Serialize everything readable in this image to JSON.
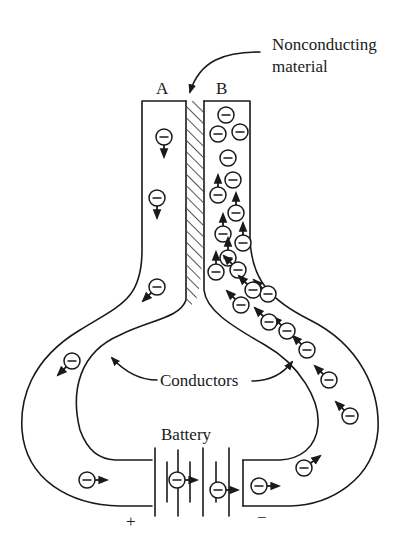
{
  "labels": {
    "a": "A",
    "b": "B",
    "nonconducting_1": "Nonconducting",
    "nonconducting_2": "material",
    "conductors": "Conductors",
    "battery": "Battery",
    "plus": "+",
    "minus": "−"
  },
  "colors": {
    "ink": "#1a1a1a",
    "background": "#ffffff"
  },
  "electrons": [
    {
      "x": 164,
      "y": 137,
      "dir": "down"
    },
    {
      "x": 157,
      "y": 198,
      "dir": "down"
    },
    {
      "x": 157,
      "y": 287,
      "dir": "down-left"
    },
    {
      "x": 72,
      "y": 361,
      "dir": "down-left"
    },
    {
      "x": 87,
      "y": 480,
      "dir": "right"
    },
    {
      "x": 177,
      "y": 480,
      "dir": "right"
    },
    {
      "x": 218,
      "y": 490,
      "dir": "right"
    },
    {
      "x": 259,
      "y": 486,
      "dir": "right"
    },
    {
      "x": 304,
      "y": 468,
      "dir": "up-right"
    },
    {
      "x": 350,
      "y": 416,
      "dir": "up-left"
    },
    {
      "x": 329,
      "y": 380,
      "dir": "up-left"
    },
    {
      "x": 307,
      "y": 350,
      "dir": "up-left"
    },
    {
      "x": 287,
      "y": 331,
      "dir": "up-left"
    },
    {
      "x": 269,
      "y": 322,
      "dir": "up-left"
    },
    {
      "x": 268,
      "y": 294,
      "dir": "up-left"
    },
    {
      "x": 241,
      "y": 305,
      "dir": "up-left"
    },
    {
      "x": 226,
      "y": 115,
      "dir": "none"
    },
    {
      "x": 240,
      "y": 132,
      "dir": "none"
    },
    {
      "x": 218,
      "y": 134,
      "dir": "none"
    },
    {
      "x": 228,
      "y": 158,
      "dir": "none"
    },
    {
      "x": 233,
      "y": 180,
      "dir": "none"
    },
    {
      "x": 218,
      "y": 195,
      "dir": "up"
    },
    {
      "x": 236,
      "y": 213,
      "dir": "up"
    },
    {
      "x": 223,
      "y": 234,
      "dir": "up"
    },
    {
      "x": 243,
      "y": 243,
      "dir": "up"
    },
    {
      "x": 228,
      "y": 258,
      "dir": "up"
    },
    {
      "x": 238,
      "y": 270,
      "dir": "up-left"
    },
    {
      "x": 216,
      "y": 272,
      "dir": "up"
    },
    {
      "x": 253,
      "y": 290,
      "dir": "up-left"
    }
  ]
}
